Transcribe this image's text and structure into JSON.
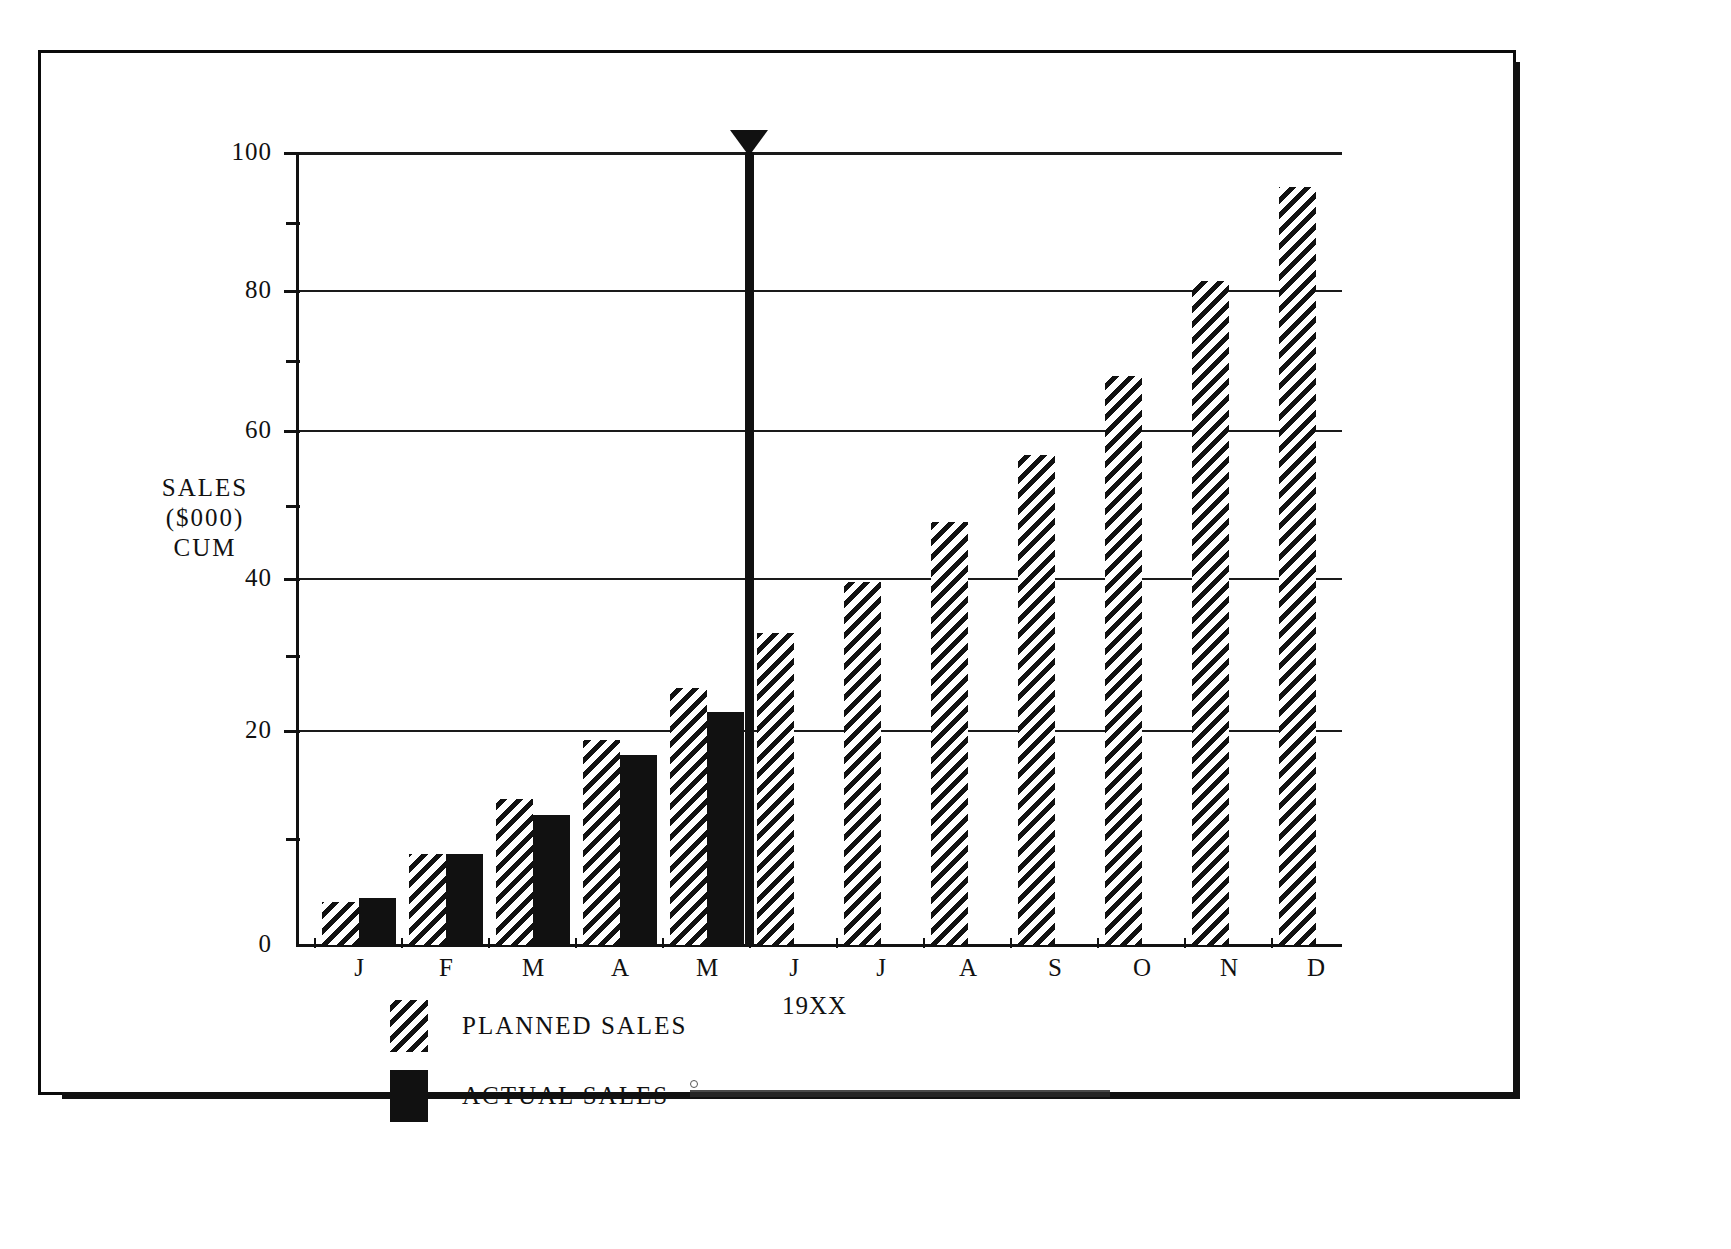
{
  "chart_data": {
    "type": "bar",
    "title": "",
    "subtitle": "",
    "xlabel": "19XX",
    "ylabel": "SALES\n($000)\nCUM",
    "ylabel_lines": [
      "SALES",
      "($000)",
      "CUM"
    ],
    "categories": [
      "J",
      "F",
      "M",
      "A",
      "M",
      "J",
      "J",
      "A",
      "S",
      "O",
      "N",
      "D"
    ],
    "series": [
      {
        "name": "PLANNED SALES",
        "fill": "hatched",
        "values": [
          5.5,
          11.5,
          18.5,
          26,
          32.5,
          39.5,
          46,
          53.5,
          62,
          72,
          84,
          96
        ]
      },
      {
        "name": "ACTUAL SALES",
        "fill": "solid",
        "values": [
          6,
          11.5,
          16.5,
          24,
          29.5,
          null,
          null,
          null,
          null,
          null,
          null,
          null
        ]
      }
    ],
    "ylim": [
      0,
      100
    ],
    "yticks": [
      0,
      20,
      40,
      60,
      80,
      100
    ],
    "ytick_labels": [
      "0",
      "20",
      "40",
      "60",
      "80",
      "100"
    ],
    "yminor_ticks": [
      10,
      30,
      50,
      70,
      90
    ],
    "grid": true,
    "grid_axis": "y",
    "legend_position": "below-left",
    "annotations": [
      {
        "name": "current-period-marker",
        "type": "vertical-line-with-arrow",
        "position_between": [
          "M",
          "J"
        ],
        "label": ""
      }
    ]
  },
  "axis": {
    "y_tick_labels": [
      "100",
      "80",
      "60",
      "40",
      "20",
      "0"
    ],
    "y_title_lines": [
      "SALES",
      "($000)",
      "CUM"
    ],
    "x_title": "19XX",
    "x_tick_labels": [
      "J",
      "F",
      "M",
      "A",
      "M",
      "J",
      "J",
      "A",
      "S",
      "O",
      "N",
      "D"
    ]
  },
  "legend": {
    "items": [
      {
        "label": "PLANNED SALES",
        "style": "hatched"
      },
      {
        "label": "ACTUAL SALES",
        "style": "solid"
      }
    ]
  },
  "colors": {
    "ink": "#111111",
    "paper": "#ffffff"
  }
}
